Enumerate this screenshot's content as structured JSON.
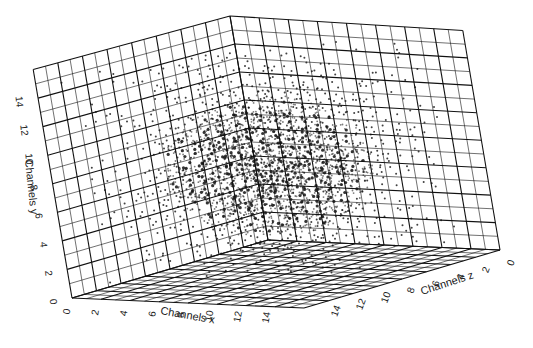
{
  "chart_data": {
    "type": "scatter3d",
    "title": "",
    "axes": {
      "x": {
        "label": "Channels x",
        "ticks": [
          0,
          2,
          4,
          6,
          8,
          10,
          12,
          14
        ],
        "range": [
          0,
          16
        ]
      },
      "y": {
        "label": "Channels y",
        "ticks": [
          0,
          2,
          4,
          6,
          8,
          10,
          12,
          14
        ],
        "range": [
          0,
          16
        ]
      },
      "z": {
        "label": "Channels z",
        "ticks": [
          0,
          2,
          4,
          6,
          8,
          10,
          12,
          14
        ],
        "range": [
          0,
          16
        ]
      }
    },
    "grid": true,
    "grid_divisions": 16,
    "cluster": {
      "center": [
        7,
        8,
        7
      ],
      "radius": [
        5,
        5,
        6
      ]
    },
    "colors": {
      "grid": "#111111",
      "points": "#111111",
      "background": "#ffffff"
    }
  },
  "labels": {
    "x_axis": "Channels x",
    "y_axis": "Channels y",
    "z_axis": "Channels z"
  }
}
